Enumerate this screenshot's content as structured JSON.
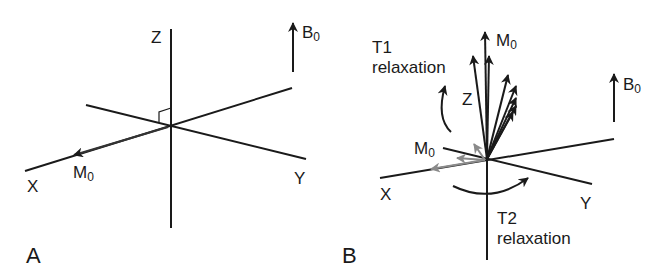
{
  "panelA": {
    "letter": "A",
    "axes": {
      "z": "Z",
      "x": "X",
      "y": "Y"
    },
    "magnetization": {
      "base": "M",
      "sub": "0"
    },
    "field": {
      "base": "B",
      "sub": "0"
    }
  },
  "panelB": {
    "letter": "B",
    "axes": {
      "z": "Z",
      "x": "X",
      "y": "Y"
    },
    "magnetization_top": {
      "base": "M",
      "sub": "0"
    },
    "magnetization_transverse": {
      "base": "M",
      "sub": "0"
    },
    "field": {
      "base": "B",
      "sub": "0"
    },
    "t1": {
      "line1": "T1",
      "line2": "relaxation"
    },
    "t2": {
      "line1": "T2",
      "line2": "relaxation"
    }
  },
  "colors": {
    "ink": "#1a1a1a",
    "gray_vector": "#8a8a8a"
  }
}
